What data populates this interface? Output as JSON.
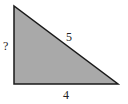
{
  "diagram": {
    "shape": "right-triangle",
    "fill_color": "#a9a9a9",
    "stroke_color": "#1a1a1a",
    "labels": {
      "vertical_side": "?",
      "hypotenuse": "5",
      "base": "4"
    }
  }
}
